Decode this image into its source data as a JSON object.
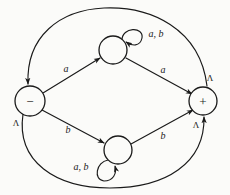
{
  "figure": {
    "type": "state-transition-diagram",
    "background_color": "#fbfbf9",
    "stroke_color": "#1a1a1a",
    "width": 230,
    "height": 195
  },
  "nodes": [
    {
      "id": "minus",
      "glyph": "−",
      "cx": 30,
      "cy": 101,
      "r": 15
    },
    {
      "id": "top",
      "glyph": "",
      "cx": 113,
      "cy": 50,
      "r": 14
    },
    {
      "id": "bottom",
      "glyph": "",
      "cx": 118,
      "cy": 150,
      "r": 14
    },
    {
      "id": "plus",
      "glyph": "+",
      "cx": 203,
      "cy": 101,
      "r": 14
    }
  ],
  "edges": [
    {
      "id": "minus-to-top",
      "label": "a",
      "label_x": 66,
      "label_y": 68
    },
    {
      "id": "top-to-plus",
      "label": "a",
      "label_x": 163,
      "label_y": 69
    },
    {
      "id": "minus-to-bottom",
      "label": "b",
      "label_x": 68,
      "label_y": 129
    },
    {
      "id": "bottom-to-plus",
      "label": "b",
      "label_x": 163,
      "label_y": 135
    },
    {
      "id": "top-self-loop",
      "label": "a, b",
      "label_x": 156,
      "label_y": 33
    },
    {
      "id": "bottom-self-loop",
      "label": "a, b",
      "label_x": 81,
      "label_y": 166
    },
    {
      "id": "plus-to-minus-top-arc",
      "label": "Λ",
      "label_x": 210,
      "label_y": 78
    },
    {
      "id": "minus-to-plus-bottom-arc",
      "label": "Λ",
      "label_x": 16,
      "label_y": 123
    }
  ],
  "extra_labels": [
    {
      "id": "plus-lower-lambda",
      "text": "Λ",
      "x": 196,
      "y": 125
    }
  ]
}
